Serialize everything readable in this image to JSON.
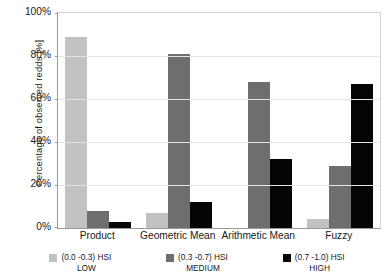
{
  "chart_data": {
    "type": "bar",
    "title": "",
    "subtitle": "",
    "xlabel": "",
    "ylabel": "Percentage of observed redds [%]",
    "ylim": [
      0,
      100
    ],
    "yticks": [
      "0%",
      "20%",
      "40%",
      "60%",
      "80%",
      "100%"
    ],
    "ytick_values": [
      0,
      20,
      40,
      60,
      80,
      100
    ],
    "grid": "horizontal",
    "legend_position": "bottom",
    "categories": [
      "Product",
      "Geometric Mean",
      "Arithmetic Mean",
      "Fuzzy"
    ],
    "series": [
      {
        "name": "(0.0 -0.3) HSI LOW",
        "range_label": "(0.0 -0.3) HSI",
        "class_label": "LOW",
        "color": "#c2c2c2",
        "values": [
          89,
          7,
          0,
          4
        ]
      },
      {
        "name": "(0.3 -0.7) HSI MEDIUM",
        "range_label": "(0.3 -0.7) HSI",
        "class_label": "MEDIUM",
        "color": "#6e6e6e",
        "values": [
          8,
          81,
          68,
          29
        ]
      },
      {
        "name": "(0.7 -1.0) HSI HIGH",
        "range_label": "(0.7 -1.0) HSI",
        "class_label": "HIGH",
        "color": "#050505",
        "values": [
          3,
          12,
          32,
          67
        ]
      }
    ]
  }
}
